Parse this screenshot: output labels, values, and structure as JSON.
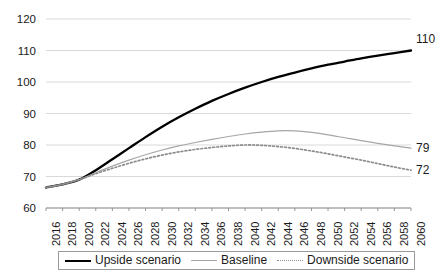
{
  "chart_data": {
    "type": "line",
    "title": "",
    "xlabel": "",
    "ylabel": "",
    "xlim": [
      2016,
      2060
    ],
    "ylim": [
      60,
      120
    ],
    "yticks": [
      60,
      70,
      80,
      90,
      100,
      110,
      120
    ],
    "grid": true,
    "legend_position": "bottom",
    "categories": [
      2016,
      2018,
      2020,
      2022,
      2024,
      2026,
      2028,
      2030,
      2032,
      2034,
      2036,
      2038,
      2040,
      2042,
      2044,
      2046,
      2048,
      2050,
      2052,
      2054,
      2056,
      2058,
      2060
    ],
    "xtick_labels": [
      "2016",
      "2018",
      "2020",
      "2022",
      "2024",
      "2026",
      "2028",
      "2030",
      "2032",
      "2034",
      "2036",
      "2038",
      "2040",
      "2042",
      "2044",
      "2046",
      "2048",
      "2050",
      "2052",
      "2054",
      "2056",
      "2058",
      "2060"
    ],
    "ytick_labels": [
      "60",
      "70",
      "80",
      "90",
      "100",
      "110",
      "120"
    ],
    "series": [
      {
        "name": "Upside scenario",
        "style": "solid-thick",
        "color": "#000000",
        "end_label": "110",
        "values": [
          66.5,
          67.5,
          69.0,
          72.0,
          75.5,
          79.0,
          82.5,
          85.8,
          88.8,
          91.5,
          94.0,
          96.2,
          98.2,
          100.0,
          101.6,
          103.0,
          104.3,
          105.5,
          106.5,
          107.5,
          108.4,
          109.2,
          110.0
        ]
      },
      {
        "name": "Baseline",
        "style": "solid-thin",
        "color": "#a6a6a6",
        "end_label": "79",
        "values": [
          66.5,
          67.5,
          69.0,
          71.2,
          73.3,
          75.2,
          76.9,
          78.4,
          79.7,
          80.8,
          81.8,
          82.7,
          83.5,
          84.1,
          84.5,
          84.5,
          84.0,
          83.2,
          82.3,
          81.4,
          80.5,
          79.7,
          79.0
        ]
      },
      {
        "name": "Downside scenario",
        "style": "dotted",
        "color": "#8c8c8c",
        "end_label": "72",
        "values": [
          66.5,
          67.5,
          69.0,
          70.9,
          72.6,
          74.2,
          75.6,
          76.8,
          77.8,
          78.6,
          79.2,
          79.7,
          80.0,
          79.9,
          79.5,
          78.9,
          78.1,
          77.2,
          76.2,
          75.2,
          74.1,
          73.0,
          72.0
        ]
      }
    ]
  },
  "legend": {
    "items": [
      {
        "label": "Upside scenario"
      },
      {
        "label": "Baseline"
      },
      {
        "label": "Downside scenario"
      }
    ]
  }
}
